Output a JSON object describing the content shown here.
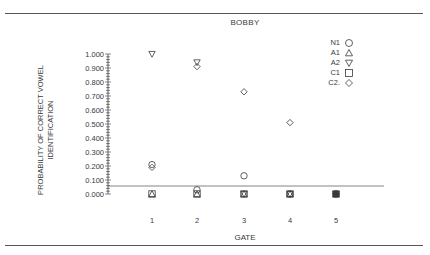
{
  "chart_data": {
    "type": "scatter",
    "title": "BOBBY",
    "xlabel": "GATE",
    "ylabel": "PROBABILITY OF CORRECT VOWEL IDENTIFICATION",
    "ylabel_lines": [
      "PROBABILITY OF CORRECT VOWEL",
      "IDENTIFICATION"
    ],
    "x": [
      1,
      2,
      3,
      4,
      5
    ],
    "x_tick_labels": [
      "1",
      "2",
      "3",
      "4",
      "5"
    ],
    "y_tick_labels": [
      "1.000",
      "0.900",
      "0.800",
      "0.700",
      "0.600",
      "0.500",
      "0.400",
      "0.300",
      "0.200",
      "0.100",
      "0.000"
    ],
    "ylim": [
      0,
      1.0
    ],
    "reference_line_y": 0.05,
    "grid": false,
    "legend_position": "upper right",
    "series": [
      {
        "name": "N1",
        "marker": "circle",
        "values": [
          0.21,
          0.03,
          0.13,
          0.0,
          0.0
        ]
      },
      {
        "name": "A1",
        "marker": "triangle-up",
        "values": [
          0.0,
          0.0,
          0.0,
          0.0,
          0.0
        ]
      },
      {
        "name": "A2",
        "marker": "triangle-down",
        "values": [
          1.0,
          0.94,
          0.0,
          0.0,
          0.0
        ]
      },
      {
        "name": "C1",
        "marker": "square",
        "values": [
          0.0,
          0.0,
          0.0,
          0.0,
          0.0
        ]
      },
      {
        "name": "C2.",
        "marker": "diamond",
        "values": [
          0.19,
          0.91,
          0.73,
          0.51,
          0.0
        ]
      }
    ]
  },
  "legend": [
    {
      "label": "N1",
      "marker": "circle"
    },
    {
      "label": "A1",
      "marker": "triangle-up"
    },
    {
      "label": "A2",
      "marker": "triangle-down"
    },
    {
      "label": "C1",
      "marker": "square"
    },
    {
      "label": "C2.",
      "marker": "diamond"
    }
  ],
  "colors": {
    "ink": "#3a3a3a",
    "rule": "#555555",
    "background": "#ffffff"
  }
}
